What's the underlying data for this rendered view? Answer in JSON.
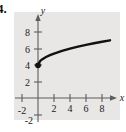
{
  "figure": {
    "problem_number": "4.",
    "axis_labels": {
      "x": "x",
      "y": "y"
    },
    "x_tick_labels": [
      "-2",
      "2",
      "4",
      "6",
      "8"
    ],
    "y_tick_labels": [
      "-2",
      "2",
      "4",
      "6",
      "8"
    ],
    "colors": {
      "panel_background": "#e9e7e5",
      "page_background": "#ffffff",
      "axis": "#5d5d5d",
      "curve": "#111111",
      "text": "#1a1a1a"
    }
  },
  "chart_data": {
    "type": "line",
    "title": "",
    "subtitle": "",
    "xlabel": "x",
    "ylabel": "y",
    "xlim": [
      -3,
      10
    ],
    "ylim": [
      -3,
      9
    ],
    "grid": false,
    "legend": null,
    "xticks": [
      -2,
      2,
      4,
      6,
      8
    ],
    "yticks": [
      -2,
      2,
      4,
      6,
      8
    ],
    "annotations": [
      {
        "type": "point",
        "x": 0,
        "y": 4,
        "style": "filled-dot",
        "label": ""
      }
    ],
    "series": [
      {
        "name": "y = sqrt(x) + 4",
        "style": "solid",
        "x": [
          0,
          0.25,
          0.5,
          1,
          1.5,
          2,
          3,
          4,
          5,
          6,
          7,
          8,
          9
        ],
        "y": [
          4.0,
          4.5,
          4.71,
          5.0,
          5.22,
          5.41,
          5.73,
          6.0,
          6.24,
          6.45,
          6.65,
          6.83,
          7.0
        ]
      }
    ]
  }
}
